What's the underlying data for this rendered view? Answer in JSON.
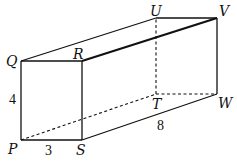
{
  "diagram": {
    "type": "rectangular-prism",
    "vertices": {
      "P": {
        "label": "P",
        "x": 21,
        "y": 140
      },
      "Q": {
        "label": "Q",
        "x": 21,
        "y": 61
      },
      "R": {
        "label": "R",
        "x": 82,
        "y": 61
      },
      "S": {
        "label": "S",
        "x": 82,
        "y": 140
      },
      "T": {
        "label": "T",
        "x": 156,
        "y": 94
      },
      "U": {
        "label": "U",
        "x": 156,
        "y": 18
      },
      "V": {
        "label": "V",
        "x": 217,
        "y": 18
      },
      "W": {
        "label": "W",
        "x": 217,
        "y": 94
      }
    },
    "dimensions": {
      "PQ": "4",
      "PS": "3",
      "SW": "8"
    },
    "visible_edges": [
      "PQ",
      "QR",
      "RS",
      "SP",
      "QU",
      "UV",
      "RV",
      "VW",
      "SW"
    ],
    "hidden_edges": [
      "PT",
      "TU",
      "TW"
    ],
    "emphasized_edges": [
      "RV"
    ]
  }
}
